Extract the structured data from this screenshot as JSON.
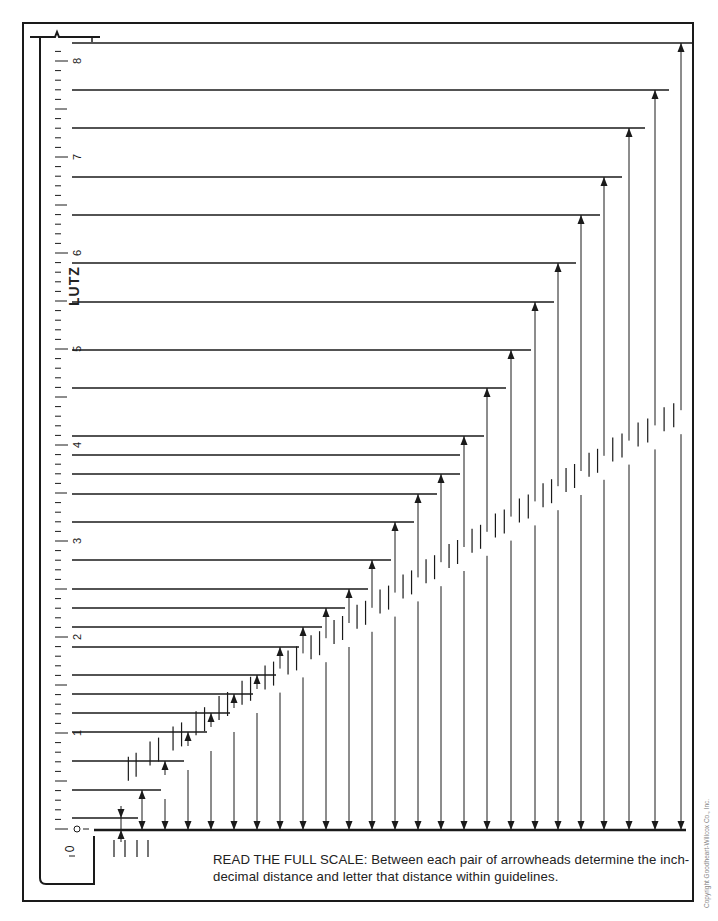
{
  "ruler": {
    "brand": "LUTZ",
    "zero_label": "0",
    "major_labels": [
      {
        "value": "1",
        "y": 733
      },
      {
        "value": "2",
        "y": 637
      },
      {
        "value": "3",
        "y": 541
      },
      {
        "value": "4",
        "y": 445
      },
      {
        "value": "5",
        "y": 349
      },
      {
        "value": "6",
        "y": 253
      },
      {
        "value": "7",
        "y": 157
      },
      {
        "value": "8",
        "y": 61
      }
    ],
    "origin_y": 829,
    "px_per_inch": 96,
    "ticks_per_inch": 10
  },
  "exercise": {
    "instructions": "READ THE FULL SCALE: Between each pair of arrowheads determine the inch-decimal distance and letter that distance within guidelines.",
    "baseline_y": 830,
    "measurements": [
      {
        "x": 121,
        "top_y": 818,
        "guide_end_x": 130
      },
      {
        "x": 142,
        "top_y": 790,
        "guide_end_x": 153
      },
      {
        "x": 165,
        "top_y": 761,
        "guide_end_x": 176
      },
      {
        "x": 188,
        "top_y": 732,
        "guide_end_x": 199
      },
      {
        "x": 211,
        "top_y": 713,
        "guide_end_x": 222
      },
      {
        "x": 234,
        "top_y": 694,
        "guide_end_x": 245
      },
      {
        "x": 257,
        "top_y": 675,
        "guide_end_x": 268
      },
      {
        "x": 280,
        "top_y": 647,
        "guide_end_x": 291
      },
      {
        "x": 303,
        "top_y": 627,
        "guide_end_x": 314
      },
      {
        "x": 326,
        "top_y": 608,
        "guide_end_x": 337
      },
      {
        "x": 349,
        "top_y": 589,
        "guide_end_x": 360
      },
      {
        "x": 372,
        "top_y": 560,
        "guide_end_x": 383
      },
      {
        "x": 395,
        "top_y": 522,
        "guide_end_x": 406
      },
      {
        "x": 418,
        "top_y": 494,
        "guide_end_x": 429
      },
      {
        "x": 441,
        "top_y": 474,
        "guide_end_x": 452
      },
      {
        "x": 464,
        "top_y": 436,
        "guide_end_x": 476
      },
      {
        "x": 487,
        "top_y": 388,
        "guide_end_x": 498
      },
      {
        "x": 511,
        "top_y": 350,
        "guide_end_x": 523
      },
      {
        "x": 535,
        "top_y": 302,
        "guide_end_x": 546
      },
      {
        "x": 558,
        "top_y": 263,
        "guide_end_x": 568
      },
      {
        "x": 581,
        "top_y": 215,
        "guide_end_x": 592
      },
      {
        "x": 604,
        "top_y": 177,
        "guide_end_x": 614
      },
      {
        "x": 629,
        "top_y": 128,
        "guide_end_x": 637
      },
      {
        "x": 655,
        "top_y": 90,
        "guide_end_x": 661
      },
      {
        "x": 681,
        "top_y": 43,
        "guide_end_x": 686
      }
    ],
    "extra_guides": [
      {
        "y": 455,
        "end_x": 452
      }
    ]
  },
  "footer": {
    "copyright": "Copyright Goodheart-Willcox Co., Inc."
  },
  "colors": {
    "ink": "#1a1a1a",
    "paper": "#ffffff"
  }
}
